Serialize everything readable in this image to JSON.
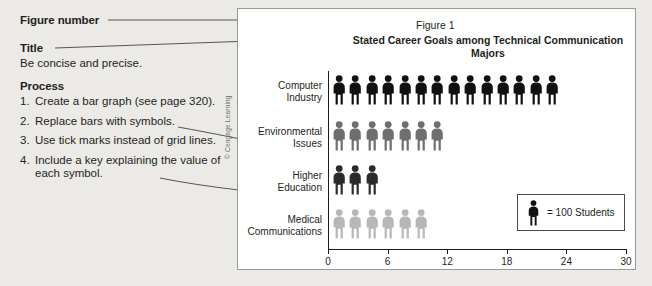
{
  "annotations": {
    "figure_number_label": "Figure number",
    "title_label": "Title",
    "title_hint": "Be concise and precise.",
    "process_label": "Process",
    "steps": [
      {
        "num": "1.",
        "text": "Create a bar graph (see page 320)."
      },
      {
        "num": "2.",
        "text": "Replace bars with symbols."
      },
      {
        "num": "3.",
        "text": "Use tick marks instead of grid lines."
      },
      {
        "num": "4.",
        "text": "Include a key explaining the value of each symbol."
      }
    ]
  },
  "panel": {
    "credit": "© Cengage Learning",
    "figure_number": "Figure 1",
    "title": "Stated Career Goals among Technical Communication Majors",
    "key": {
      "symbol": "person-icon",
      "text": "= 100 Students"
    }
  },
  "chart_data": {
    "type": "bar",
    "title": "Stated Career Goals among Technical Communication Majors",
    "figure_number": "Figure 1",
    "xlabel": "",
    "ylabel": "",
    "xlim": [
      0,
      30
    ],
    "xticks": [
      "0",
      "6",
      "12",
      "18",
      "24",
      "30"
    ],
    "grid": false,
    "unit": "100 Students",
    "unit_per_symbol": 2,
    "orientation": "horizontal",
    "categories": [
      "Computer Industry",
      "Environmental Issues",
      "Higher Education",
      "Medical Communications"
    ],
    "symbol_counts": [
      14,
      7,
      3,
      6
    ],
    "values": [
      28,
      14,
      6,
      12
    ],
    "colors": [
      "#111111",
      "#6e6e6e",
      "#2b2b2b",
      "#b7b7b7"
    ]
  }
}
